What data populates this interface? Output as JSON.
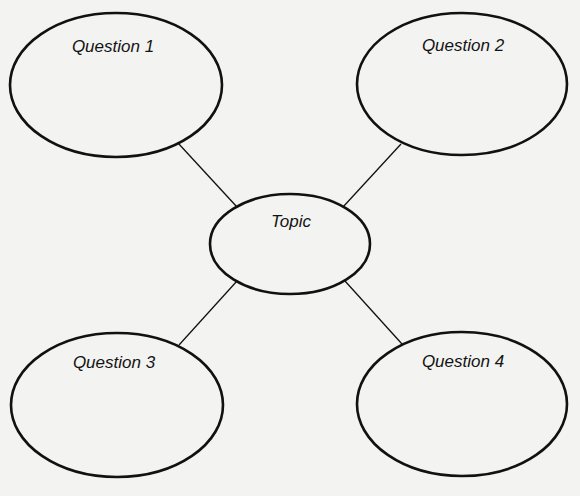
{
  "diagram": {
    "type": "concept-web",
    "background": "#f3f3f1",
    "stroke_color": "#111111",
    "center": {
      "label": "Topic",
      "cx": 290,
      "cy": 244,
      "rx": 80,
      "ry": 50,
      "label_x": 291,
      "label_y": 213
    },
    "nodes": [
      {
        "id": "q1",
        "label": "Question 1",
        "cx": 116,
        "cy": 85,
        "rx": 106,
        "ry": 72,
        "label_x": 113,
        "label_y": 38
      },
      {
        "id": "q2",
        "label": "Question 2",
        "cx": 462,
        "cy": 84,
        "rx": 105,
        "ry": 71,
        "label_x": 463,
        "label_y": 37
      },
      {
        "id": "q3",
        "label": "Question 3",
        "cx": 117,
        "cy": 405,
        "rx": 106,
        "ry": 72,
        "label_x": 114,
        "label_y": 354
      },
      {
        "id": "q4",
        "label": "Question 4",
        "cx": 462,
        "cy": 404,
        "rx": 105,
        "ry": 72,
        "label_x": 463,
        "label_y": 353
      }
    ],
    "edges": [
      {
        "from": "q1",
        "to": "center",
        "x1": 178,
        "y1": 143,
        "x2": 237,
        "y2": 207
      },
      {
        "from": "q2",
        "to": "center",
        "x1": 401,
        "y1": 144,
        "x2": 343,
        "y2": 207
      },
      {
        "from": "q3",
        "to": "center",
        "x1": 179,
        "y1": 345,
        "x2": 237,
        "y2": 281
      },
      {
        "from": "q4",
        "to": "center",
        "x1": 402,
        "y1": 344,
        "x2": 345,
        "y2": 281
      }
    ]
  }
}
